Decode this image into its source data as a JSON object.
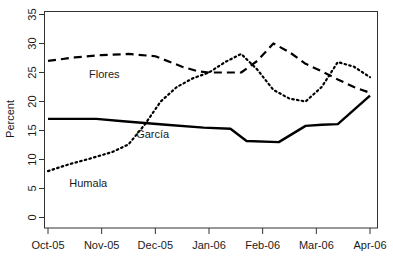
{
  "chart_data": {
    "type": "line",
    "title": "",
    "xlabel": "",
    "ylabel": "Percent",
    "ylim": [
      0,
      35
    ],
    "grid": false,
    "legend": "inline-labels",
    "categories": [
      "Oct-05",
      "Nov-05",
      "Dec-05",
      "Jan-06",
      "Feb-06",
      "Mar-06",
      "Apr-06"
    ],
    "ytick_labels": [
      "0",
      "5",
      "10",
      "15",
      "20",
      "25",
      "30",
      "35"
    ],
    "ytick_values": [
      0,
      5,
      10,
      15,
      20,
      25,
      30,
      35
    ],
    "series": [
      {
        "name": "Flores",
        "style": "dashed",
        "label_x": 1.05,
        "label_y": 24.0,
        "x": [
          0.0,
          0.5,
          1.0,
          1.5,
          2.0,
          2.5,
          2.8,
          3.0,
          3.3,
          3.6,
          3.9,
          4.2,
          4.5,
          4.8,
          5.1,
          5.4,
          5.7,
          6.0
        ],
        "values": [
          27.0,
          27.6,
          28.0,
          28.2,
          27.8,
          26.0,
          25.2,
          25.0,
          25.0,
          25.0,
          27.0,
          30.0,
          28.5,
          26.5,
          25.2,
          23.8,
          22.5,
          21.5
        ]
      },
      {
        "name": "Humala",
        "style": "dotted",
        "label_x": 0.75,
        "label_y": 5.2,
        "x": [
          0.0,
          0.4,
          0.8,
          1.2,
          1.5,
          1.8,
          2.1,
          2.4,
          2.7,
          3.0,
          3.3,
          3.6,
          3.9,
          4.2,
          4.5,
          4.8,
          5.1,
          5.4,
          5.7,
          6.0
        ],
        "values": [
          8.0,
          9.2,
          10.2,
          11.3,
          12.6,
          16.0,
          20.0,
          22.5,
          24.0,
          25.0,
          26.8,
          28.2,
          25.5,
          22.0,
          20.5,
          20.0,
          22.5,
          26.8,
          26.0,
          24.2
        ]
      },
      {
        "name": "García",
        "style": "solid",
        "label_x": 1.95,
        "label_y": 13.7,
        "x": [
          0.0,
          0.9,
          1.4,
          2.2,
          2.9,
          3.4,
          3.7,
          4.3,
          4.8,
          5.1,
          5.4,
          6.0
        ],
        "values": [
          17.0,
          17.0,
          16.6,
          16.0,
          15.5,
          15.3,
          13.2,
          13.0,
          15.8,
          16.0,
          16.1,
          21.0
        ]
      }
    ]
  },
  "axis": {
    "y_title": "Percent"
  }
}
